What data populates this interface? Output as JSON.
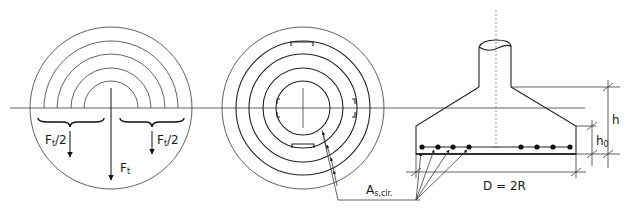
{
  "figure": {
    "left_view": {
      "label_half_left": "F",
      "label_half_left_sub": "t",
      "label_half_left_suffix": "/2",
      "label_half_right": "F",
      "label_half_right_sub": "t",
      "label_half_right_suffix": "/2",
      "label_total": "F",
      "label_total_sub": "t"
    },
    "middle_view": {
      "reinforcement_label": "A",
      "reinforcement_label_sub": "s,cir."
    },
    "right_view": {
      "dimension_height": "h",
      "dimension_effective_depth": "h",
      "dimension_effective_depth_sub": "0",
      "dimension_diameter": "D = 2R"
    },
    "colors": {
      "line": "#222222",
      "background": "#ffffff"
    }
  }
}
